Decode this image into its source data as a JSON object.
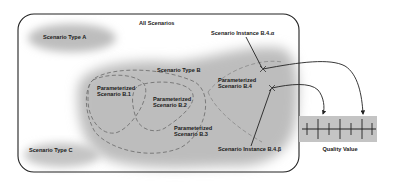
{
  "diagram": {
    "title": "All Scenarios",
    "scenario_types": [
      {
        "id": "A",
        "label": "Scenario Type A"
      },
      {
        "id": "B",
        "label": "Scenario Type B"
      },
      {
        "id": "C",
        "label": "Scenario Type C"
      }
    ],
    "parameterized_scenarios": [
      {
        "id": "B.1",
        "line1": "Parameterized",
        "line2": "Scenario B.1"
      },
      {
        "id": "B.2",
        "line1": "Parameterized",
        "line2": "Scenario B.2"
      },
      {
        "id": "B.3",
        "line1": "Parameterized",
        "line2": "Scenario B.3"
      },
      {
        "id": "B.4",
        "line1": "Parameterized",
        "line2": "Scenario B.4"
      }
    ],
    "instances": [
      {
        "id": "B.4.alpha",
        "label": "Scenario Instance B.4.α"
      },
      {
        "id": "B.4.beta",
        "label": "Scenario Instance B.4.β"
      }
    ],
    "quality_scale": {
      "label": "Quality Value",
      "ticks": 7
    },
    "colors": {
      "region_fill": "#bdbdbd",
      "outline": "#222222",
      "dashed": "#7a7a7a",
      "scale_fill": "#c4c4c4"
    }
  }
}
